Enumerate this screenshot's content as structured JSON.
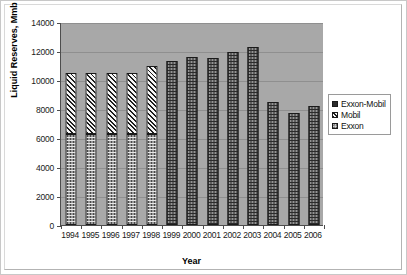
{
  "chart_data": {
    "type": "bar",
    "stacked": true,
    "title": "",
    "xlabel": "Year",
    "ylabel": "Liquid Reserves, Mmb",
    "categories": [
      "1994",
      "1995",
      "1996",
      "1997",
      "1998",
      "1999",
      "2000",
      "2001",
      "2002",
      "2003",
      "2004",
      "2005",
      "2006"
    ],
    "ylim": [
      0,
      14000
    ],
    "ytick_values": [
      0,
      2000,
      4000,
      6000,
      8000,
      10000,
      12000,
      14000
    ],
    "ytick_labels": [
      "0",
      "2000",
      "4000",
      "6000",
      "8000",
      "10000",
      "12000",
      "14000"
    ],
    "grid": true,
    "legend_position": "right",
    "series": [
      {
        "name": "Exxon",
        "values": [
          6300,
          6300,
          6300,
          6300,
          6300,
          null,
          null,
          null,
          null,
          null,
          null,
          null,
          null
        ]
      },
      {
        "name": "Mobil",
        "values": [
          4200,
          4200,
          4200,
          4200,
          4700,
          null,
          null,
          null,
          null,
          null,
          null,
          null,
          null
        ]
      },
      {
        "name": "Exxon-Mobil",
        "values": [
          null,
          null,
          null,
          null,
          null,
          11300,
          11600,
          11500,
          11950,
          12250,
          8450,
          7750,
          8200
        ]
      }
    ],
    "totals": [
      10500,
      10500,
      10500,
      10500,
      11000,
      11300,
      11600,
      11500,
      11950,
      12250,
      8450,
      7750,
      8200
    ]
  },
  "legend": {
    "items": [
      {
        "label": "Exxon-Mobil",
        "key": "exxonmobil"
      },
      {
        "label": "Mobil",
        "key": "mobil"
      },
      {
        "label": "Exxon",
        "key": "exxon"
      }
    ]
  },
  "colors": {
    "plot_background": "#a8a8a8",
    "page_background": "#ffffff",
    "gridline": "#8f8f8f",
    "axis": "#4d4d4d",
    "exxon_mobil_fill": "#2b2b2b",
    "exxon_fill": "#e8e8e8",
    "mobil_fill": "#f2f2f2",
    "text": "#1a1a1a"
  }
}
